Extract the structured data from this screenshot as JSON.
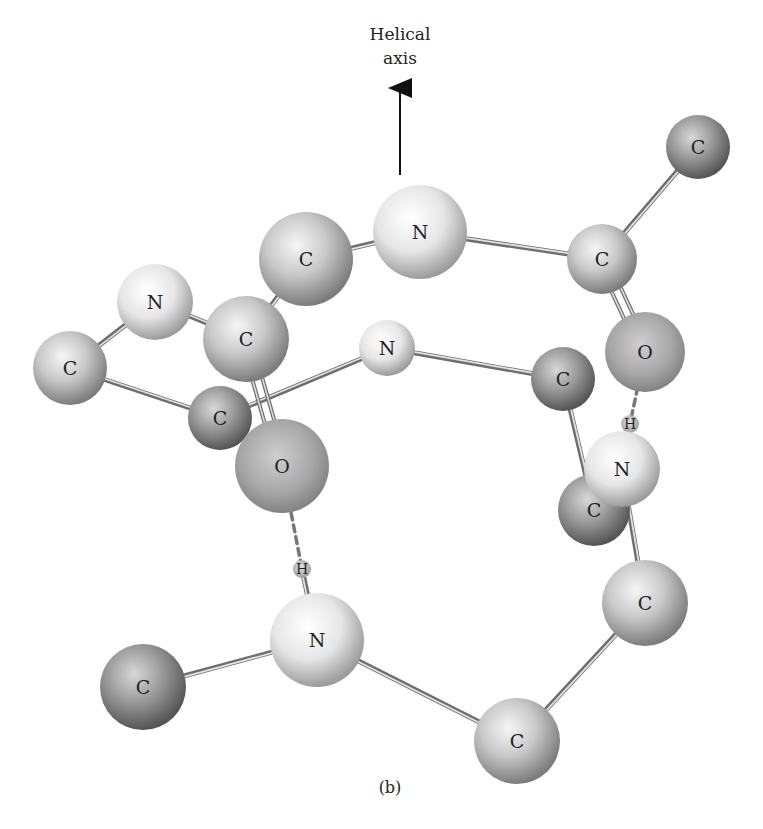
{
  "title": {
    "line1": "Helical",
    "line2": "axis"
  },
  "caption": "(b)",
  "colors": {
    "background": "#ffffff",
    "bond": "#9a9a9a",
    "hbond": "#777777",
    "text": "#222222"
  },
  "atoms": [
    {
      "id": "a1",
      "label": "C",
      "x": 698,
      "y": 147,
      "r": 32,
      "shade": "dark"
    },
    {
      "id": "a2",
      "label": "N",
      "x": 420,
      "y": 232,
      "r": 47,
      "shade": "light"
    },
    {
      "id": "a3",
      "label": "C",
      "x": 602,
      "y": 259,
      "r": 35,
      "shade": "mid"
    },
    {
      "id": "a4",
      "label": "C",
      "x": 306,
      "y": 259,
      "r": 47,
      "shade": "mid"
    },
    {
      "id": "a5",
      "label": "N",
      "x": 155,
      "y": 302,
      "r": 38,
      "shade": "light"
    },
    {
      "id": "a6",
      "label": "C",
      "x": 246,
      "y": 339,
      "r": 43,
      "shade": "mid"
    },
    {
      "id": "a7",
      "label": "N",
      "x": 387,
      "y": 348,
      "r": 28,
      "shade": "light"
    },
    {
      "id": "a8",
      "label": "O",
      "x": 645,
      "y": 352,
      "r": 40,
      "shade": "oxygen"
    },
    {
      "id": "a9",
      "label": "C",
      "x": 70,
      "y": 368,
      "r": 37,
      "shade": "mid"
    },
    {
      "id": "a10",
      "label": "C",
      "x": 563,
      "y": 379,
      "r": 32,
      "shade": "dark"
    },
    {
      "id": "a11",
      "label": "C",
      "x": 220,
      "y": 418,
      "r": 32,
      "shade": "dark"
    },
    {
      "id": "a12",
      "label": "H",
      "x": 630,
      "y": 424,
      "r": 9,
      "shade": "hydrogen"
    },
    {
      "id": "a13",
      "label": "O",
      "x": 282,
      "y": 466,
      "r": 47,
      "shade": "oxygen"
    },
    {
      "id": "a14",
      "label": "C",
      "x": 594,
      "y": 510,
      "r": 36,
      "shade": "dark"
    },
    {
      "id": "a15",
      "label": "N",
      "x": 622,
      "y": 469,
      "r": 38,
      "shade": "light"
    },
    {
      "id": "a16",
      "label": "H",
      "x": 302,
      "y": 569,
      "r": 9,
      "shade": "hydrogen"
    },
    {
      "id": "a17",
      "label": "C",
      "x": 645,
      "y": 603,
      "r": 43,
      "shade": "mid"
    },
    {
      "id": "a18",
      "label": "N",
      "x": 317,
      "y": 640,
      "r": 47,
      "shade": "light"
    },
    {
      "id": "a19",
      "label": "C",
      "x": 143,
      "y": 687,
      "r": 43,
      "shade": "dark"
    },
    {
      "id": "a20",
      "label": "C",
      "x": 517,
      "y": 741,
      "r": 43,
      "shade": "mid"
    }
  ],
  "bonds": [
    {
      "from": "a1",
      "to": "a3",
      "type": "single"
    },
    {
      "from": "a2",
      "to": "a3",
      "type": "single"
    },
    {
      "from": "a2",
      "to": "a4",
      "type": "single"
    },
    {
      "from": "a4",
      "to": "a6",
      "type": "single"
    },
    {
      "from": "a5",
      "to": "a6",
      "type": "single"
    },
    {
      "from": "a5",
      "to": "a9",
      "type": "single"
    },
    {
      "from": "a9",
      "to": "a11",
      "type": "single"
    },
    {
      "from": "a11",
      "to": "a7",
      "type": "single"
    },
    {
      "from": "a7",
      "to": "a10",
      "type": "single"
    },
    {
      "from": "a6",
      "to": "a13",
      "type": "double"
    },
    {
      "from": "a3",
      "to": "a8",
      "type": "double"
    },
    {
      "from": "a10",
      "to": "a14",
      "type": "single"
    },
    {
      "from": "a15",
      "to": "a12",
      "type": "single"
    },
    {
      "from": "a15",
      "to": "a17",
      "type": "single"
    },
    {
      "from": "a17",
      "to": "a20",
      "type": "single"
    },
    {
      "from": "a20",
      "to": "a18",
      "type": "single"
    },
    {
      "from": "a18",
      "to": "a19",
      "type": "single"
    },
    {
      "from": "a18",
      "to": "a16",
      "type": "single"
    },
    {
      "from": "a13",
      "to": "a16",
      "type": "hydrogen"
    },
    {
      "from": "a8",
      "to": "a12",
      "type": "hydrogen"
    }
  ],
  "arrow": {
    "x": 400,
    "y1": 175,
    "y2": 88
  }
}
